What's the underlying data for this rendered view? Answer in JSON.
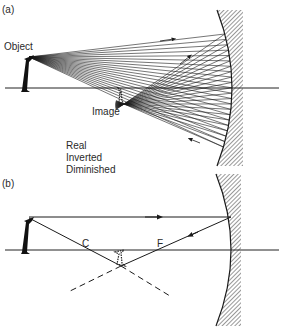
{
  "panel_a": {
    "tag": "(a)",
    "object_label": "Object",
    "image_label": "Image",
    "properties": [
      "Real",
      "Inverted",
      "Diminished"
    ]
  },
  "panel_b": {
    "tag": "(b)",
    "center_label": "C",
    "focus_label": "F"
  },
  "colors": {
    "ink": "#1a1a1a",
    "background": "#ffffff"
  }
}
